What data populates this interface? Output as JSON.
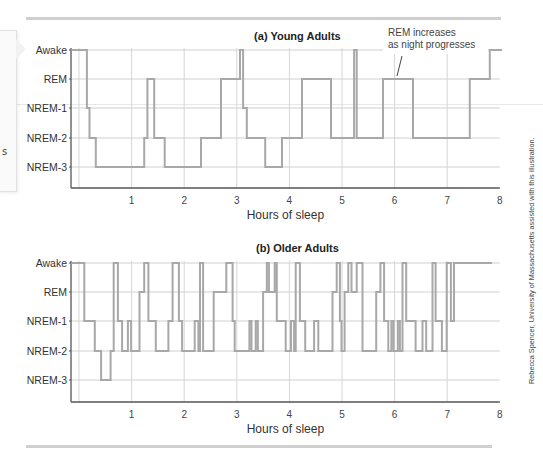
{
  "figure": {
    "credit": "Rebecca Spencer, University of Massachusetts assisted with this illustration.",
    "side_panel_fragment": "s"
  },
  "chart_data": [
    {
      "type": "line",
      "style": "step",
      "title": "(a) Young Adults",
      "xlabel": "Hours of sleep",
      "ylabel": "",
      "xlim": [
        0,
        8
      ],
      "x_ticks": [
        "1",
        "2",
        "3",
        "4",
        "5",
        "6",
        "7",
        "8"
      ],
      "y_categories": [
        "Awake",
        "REM",
        "NREM-1",
        "NREM-2",
        "NREM-3"
      ],
      "grid": true,
      "annotation": {
        "text_line1": "REM increases",
        "text_line2": "as night progresses",
        "points_to_hour": 6.0,
        "points_to_stage": "REM"
      },
      "steps": [
        {
          "t": -0.15,
          "stage": "Awake"
        },
        {
          "t": 0.15,
          "stage": "NREM-1"
        },
        {
          "t": 0.2,
          "stage": "NREM-2"
        },
        {
          "t": 0.32,
          "stage": "NREM-3"
        },
        {
          "t": 1.24,
          "stage": "NREM-2"
        },
        {
          "t": 1.3,
          "stage": "REM"
        },
        {
          "t": 1.43,
          "stage": "NREM-2"
        },
        {
          "t": 1.63,
          "stage": "NREM-3"
        },
        {
          "t": 2.32,
          "stage": "NREM-2"
        },
        {
          "t": 2.7,
          "stage": "REM"
        },
        {
          "t": 3.06,
          "stage": "Awake"
        },
        {
          "t": 3.12,
          "stage": "NREM-1"
        },
        {
          "t": 3.19,
          "stage": "NREM-2"
        },
        {
          "t": 3.54,
          "stage": "NREM-3"
        },
        {
          "t": 3.86,
          "stage": "NREM-2"
        },
        {
          "t": 4.24,
          "stage": "REM"
        },
        {
          "t": 4.79,
          "stage": "NREM-2"
        },
        {
          "t": 5.23,
          "stage": "Awake"
        },
        {
          "t": 5.28,
          "stage": "NREM-2"
        },
        {
          "t": 5.78,
          "stage": "REM"
        },
        {
          "t": 6.35,
          "stage": "NREM-2"
        },
        {
          "t": 7.43,
          "stage": "REM"
        },
        {
          "t": 7.81,
          "stage": "Awake"
        },
        {
          "t": 8.04,
          "stage": "Awake"
        }
      ]
    },
    {
      "type": "line",
      "style": "step",
      "title": "(b) Older Adults",
      "xlabel": "Hours of sleep",
      "ylabel": "",
      "xlim": [
        0,
        8
      ],
      "x_ticks": [
        "1",
        "2",
        "3",
        "4",
        "5",
        "6",
        "7",
        "8"
      ],
      "y_categories": [
        "Awake",
        "REM",
        "NREM-1",
        "NREM-2",
        "NREM-3"
      ],
      "grid": true,
      "steps": [
        {
          "t": -0.15,
          "stage": "Awake"
        },
        {
          "t": 0.1,
          "stage": "NREM-1"
        },
        {
          "t": 0.3,
          "stage": "NREM-2"
        },
        {
          "t": 0.42,
          "stage": "NREM-3"
        },
        {
          "t": 0.6,
          "stage": "NREM-2"
        },
        {
          "t": 0.66,
          "stage": "Awake"
        },
        {
          "t": 0.74,
          "stage": "NREM-1"
        },
        {
          "t": 0.82,
          "stage": "NREM-2"
        },
        {
          "t": 0.93,
          "stage": "NREM-1"
        },
        {
          "t": 0.99,
          "stage": "NREM-2"
        },
        {
          "t": 1.15,
          "stage": "REM"
        },
        {
          "t": 1.24,
          "stage": "Awake"
        },
        {
          "t": 1.32,
          "stage": "NREM-1"
        },
        {
          "t": 1.46,
          "stage": "NREM-2"
        },
        {
          "t": 1.7,
          "stage": "NREM-1"
        },
        {
          "t": 1.78,
          "stage": "Awake"
        },
        {
          "t": 1.9,
          "stage": "NREM-1"
        },
        {
          "t": 1.96,
          "stage": "NREM-2"
        },
        {
          "t": 2.2,
          "stage": "NREM-1"
        },
        {
          "t": 2.27,
          "stage": "NREM-2"
        },
        {
          "t": 2.3,
          "stage": "Awake"
        },
        {
          "t": 2.36,
          "stage": "NREM-2"
        },
        {
          "t": 2.56,
          "stage": "REM"
        },
        {
          "t": 2.8,
          "stage": "Awake"
        },
        {
          "t": 2.92,
          "stage": "NREM-1"
        },
        {
          "t": 2.96,
          "stage": "NREM-2"
        },
        {
          "t": 3.24,
          "stage": "NREM-1"
        },
        {
          "t": 3.28,
          "stage": "NREM-2"
        },
        {
          "t": 3.36,
          "stage": "NREM-1"
        },
        {
          "t": 3.4,
          "stage": "NREM-2"
        },
        {
          "t": 3.5,
          "stage": "REM"
        },
        {
          "t": 3.57,
          "stage": "Awake"
        },
        {
          "t": 3.61,
          "stage": "REM"
        },
        {
          "t": 3.72,
          "stage": "Awake"
        },
        {
          "t": 3.76,
          "stage": "NREM-1"
        },
        {
          "t": 3.93,
          "stage": "NREM-2"
        },
        {
          "t": 4.03,
          "stage": "NREM-1"
        },
        {
          "t": 4.09,
          "stage": "NREM-2"
        },
        {
          "t": 4.12,
          "stage": "Awake"
        },
        {
          "t": 4.2,
          "stage": "NREM-1"
        },
        {
          "t": 4.3,
          "stage": "NREM-2"
        },
        {
          "t": 4.47,
          "stage": "NREM-1"
        },
        {
          "t": 4.55,
          "stage": "NREM-2"
        },
        {
          "t": 4.82,
          "stage": "REM"
        },
        {
          "t": 4.9,
          "stage": "Awake"
        },
        {
          "t": 4.96,
          "stage": "NREM-1"
        },
        {
          "t": 4.99,
          "stage": "NREM-2"
        },
        {
          "t": 5.05,
          "stage": "REM"
        },
        {
          "t": 5.12,
          "stage": "Awake"
        },
        {
          "t": 5.18,
          "stage": "REM"
        },
        {
          "t": 5.28,
          "stage": "Awake"
        },
        {
          "t": 5.39,
          "stage": "NREM-2"
        },
        {
          "t": 5.65,
          "stage": "REM"
        },
        {
          "t": 5.73,
          "stage": "Awake"
        },
        {
          "t": 5.8,
          "stage": "NREM-1"
        },
        {
          "t": 5.88,
          "stage": "NREM-2"
        },
        {
          "t": 5.94,
          "stage": "NREM-1"
        },
        {
          "t": 5.98,
          "stage": "NREM-2"
        },
        {
          "t": 6.06,
          "stage": "NREM-1"
        },
        {
          "t": 6.1,
          "stage": "NREM-2"
        },
        {
          "t": 6.15,
          "stage": "Awake"
        },
        {
          "t": 6.22,
          "stage": "NREM-1"
        },
        {
          "t": 6.4,
          "stage": "NREM-2"
        },
        {
          "t": 6.53,
          "stage": "NREM-1"
        },
        {
          "t": 6.6,
          "stage": "NREM-2"
        },
        {
          "t": 6.72,
          "stage": "Awake"
        },
        {
          "t": 6.78,
          "stage": "NREM-1"
        },
        {
          "t": 6.9,
          "stage": "NREM-2"
        },
        {
          "t": 6.99,
          "stage": "Awake"
        },
        {
          "t": 7.07,
          "stage": "NREM-1"
        },
        {
          "t": 7.13,
          "stage": "Awake"
        },
        {
          "t": 7.85,
          "stage": "Awake"
        }
      ]
    }
  ]
}
